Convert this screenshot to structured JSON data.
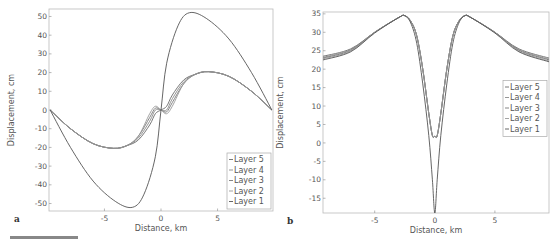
{
  "chart_data": [
    {
      "panel": "a",
      "type": "line",
      "title": "",
      "xlabel": "Distance, km",
      "ylabel": "Displacement, cm",
      "xlim": [
        -9.9,
        9.9
      ],
      "ylim": [
        -54,
        54
      ],
      "xticks": [
        "-5",
        "0",
        "5"
      ],
      "yticks": [
        "50",
        "40",
        "30",
        "20",
        "10",
        "0",
        "-10",
        "-20",
        "-30",
        "-40",
        "-50"
      ],
      "grid": false,
      "legend_position": "lower right",
      "legend": [
        "Layer 5",
        "Layer 4",
        "Layer 3",
        "Layer 2",
        "Layer 1"
      ],
      "series": [
        {
          "name": "Layer 5",
          "x": [
            -9.8,
            -8,
            -6,
            -4.2,
            -3,
            -2,
            -1,
            -0.5,
            0,
            0.5,
            1,
            2,
            3,
            4.2,
            6,
            8,
            9.8
          ],
          "values": [
            0,
            -10,
            -18,
            -20.5,
            -19,
            -16,
            -8,
            -2,
            0,
            2,
            8,
            16,
            19,
            20.5,
            18,
            10,
            0
          ]
        },
        {
          "name": "Layer 4",
          "x": [
            -9.8,
            -8,
            -6,
            -4.2,
            -3,
            -2,
            -1,
            -0.5,
            0,
            0.5,
            1,
            2,
            3,
            4.2,
            6,
            8,
            9.8
          ],
          "values": [
            0,
            -10,
            -18,
            -20.5,
            -19,
            -15,
            -6,
            0,
            0,
            0,
            6,
            15,
            19,
            20.5,
            18,
            10,
            0
          ]
        },
        {
          "name": "Layer 3",
          "x": [
            -9.8,
            -8,
            -6,
            -4.2,
            -3,
            -2,
            -1,
            -0.5,
            0,
            0.5,
            1,
            2,
            3,
            4.2,
            6,
            8,
            9.8
          ],
          "values": [
            0,
            -10,
            -18,
            -20.5,
            -19,
            -14,
            -4,
            1,
            0,
            -1,
            4,
            14,
            19,
            20.5,
            18,
            10,
            0
          ]
        },
        {
          "name": "Layer 2",
          "x": [
            -9.8,
            -8,
            -6,
            -4.2,
            -3,
            -2,
            -1,
            -0.5,
            0,
            0.5,
            1,
            2,
            3,
            4.2,
            6,
            8,
            9.8
          ],
          "values": [
            0,
            -10,
            -18,
            -20.5,
            -19,
            -14,
            -2,
            2,
            0,
            -2,
            2,
            14,
            19,
            20.5,
            18,
            10,
            0
          ]
        },
        {
          "name": "Layer 1",
          "x": [
            -9.8,
            -8,
            -6,
            -4,
            -2.5,
            -1.5,
            -0.5,
            0,
            0.5,
            1.5,
            2.5,
            4,
            6,
            8,
            9.8
          ],
          "values": [
            0,
            -20,
            -38,
            -49,
            -52,
            -45,
            -25,
            0,
            25,
            45,
            52,
            49,
            38,
            20,
            0
          ]
        }
      ]
    },
    {
      "panel": "b",
      "type": "line",
      "title": "",
      "xlabel": "Distance, km",
      "ylabel": "Displacement, cm",
      "xlim": [
        -9.3,
        9.5
      ],
      "ylim": [
        -19,
        35.5
      ],
      "xticks": [
        "-5",
        "0",
        "5"
      ],
      "yticks": [
        "35",
        "30",
        "25",
        "20",
        "15",
        "10",
        "5",
        "0",
        "-5",
        "-10",
        "-15"
      ],
      "grid": false,
      "legend_position": "center right",
      "legend": [
        "Layer 5",
        "Layer 4",
        "Layer 3",
        "Layer 2",
        "Layer 1"
      ],
      "series": [
        {
          "name": "Layer 5",
          "x": [
            -9.3,
            -7,
            -5,
            -3,
            -2.5,
            -2,
            -1.5,
            -1,
            -0.5,
            -0.2,
            0,
            0.2,
            0.5,
            1,
            1.5,
            2,
            2.5,
            3,
            5,
            7,
            9.5
          ],
          "values": [
            23.5,
            25.5,
            30,
            34,
            34.5,
            33,
            29,
            20,
            8,
            2,
            1.8,
            2,
            8,
            20,
            29,
            33,
            34.5,
            34,
            30,
            25.5,
            23
          ]
        },
        {
          "name": "Layer 4",
          "x": [
            -9.3,
            -7,
            -5,
            -3,
            -2.5,
            -2,
            -1.5,
            -1,
            -0.5,
            -0.2,
            0,
            0.2,
            0.5,
            1,
            1.5,
            2,
            2.5,
            3,
            5,
            7,
            9.5
          ],
          "values": [
            23.2,
            25.3,
            30,
            34,
            34.5,
            33,
            29,
            20,
            8,
            2,
            1.8,
            2,
            8,
            20,
            29,
            33,
            34.5,
            34,
            30,
            25.3,
            22.7
          ]
        },
        {
          "name": "Layer 3",
          "x": [
            -9.3,
            -7,
            -5,
            -3,
            -2.5,
            -2,
            -1.5,
            -1,
            -0.5,
            -0.2,
            0,
            0.2,
            0.5,
            1,
            1.5,
            2,
            2.5,
            3,
            5,
            7,
            9.5
          ],
          "values": [
            23,
            25.1,
            30,
            34,
            34.5,
            33,
            29,
            20,
            8,
            2,
            1.8,
            2,
            8,
            20,
            29,
            33,
            34.5,
            34,
            30,
            25.1,
            22.5
          ]
        },
        {
          "name": "Layer 2",
          "x": [
            -9.3,
            -7,
            -5,
            -3,
            -2.5,
            -2,
            -1.5,
            -1,
            -0.5,
            -0.2,
            0,
            0.2,
            0.5,
            1,
            1.5,
            2,
            2.5,
            3,
            5,
            7,
            9.5
          ],
          "values": [
            22.8,
            24.9,
            30,
            34,
            34.5,
            33,
            29,
            20,
            8,
            2,
            1.8,
            2,
            8,
            20,
            29,
            33,
            34.5,
            34,
            30,
            24.9,
            22.2
          ]
        },
        {
          "name": "Layer 1",
          "x": [
            -9.3,
            -7,
            -5,
            -3,
            -2.5,
            -2,
            -1.5,
            -1,
            -0.5,
            -0.2,
            0,
            0.2,
            0.5,
            1,
            1.5,
            2,
            2.5,
            3,
            5,
            7,
            9.5
          ],
          "values": [
            22.5,
            24.7,
            29.8,
            34,
            34.5,
            32.5,
            27,
            16,
            2,
            -10,
            -19,
            -10,
            2,
            16,
            27,
            32.5,
            34.5,
            34,
            29.8,
            24.7,
            22
          ]
        }
      ]
    }
  ],
  "panels": {
    "a": {
      "label": "a"
    },
    "b": {
      "label": "b"
    }
  },
  "line_color": "#555555"
}
